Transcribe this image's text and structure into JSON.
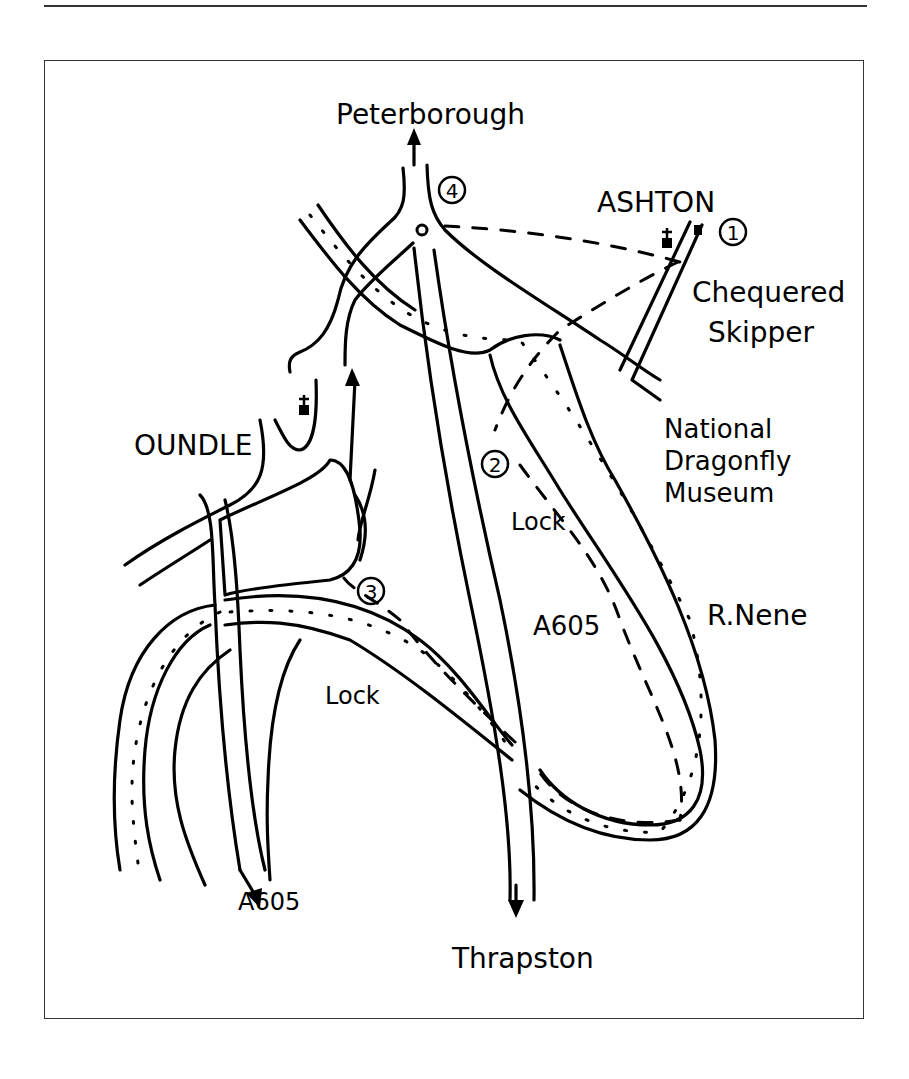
{
  "map": {
    "places": {
      "peterborough": "Peterborough",
      "ashton": "ASHTON",
      "oundle": "OUNDLE",
      "thrapston": "Thrapston"
    },
    "features": {
      "chequered_skipper_1": "Chequered",
      "chequered_skipper_2": "Skipper",
      "museum_1": "National",
      "museum_2": "Dragonfly",
      "museum_3": "Museum",
      "river": "R.Nene",
      "lock_upper": "Lock",
      "lock_lower": "Lock"
    },
    "roads": {
      "a605_main": "A605",
      "a605_south": "A605"
    },
    "waypoints": [
      "1",
      "2",
      "3",
      "4"
    ]
  }
}
